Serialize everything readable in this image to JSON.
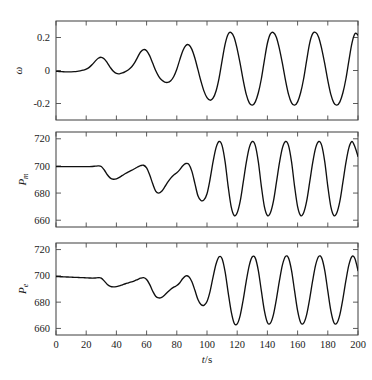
{
  "figure": {
    "background": "#ffffff",
    "line_color": "#101010",
    "axis_color": "#3c3c3c"
  },
  "chart_data": [
    {
      "type": "line",
      "panel_index": 0,
      "title": "",
      "xlabel": "",
      "ylabel": "ω",
      "ylabel_parts": {
        "base": "ω",
        "sub": ""
      },
      "xlim": [
        0,
        200
      ],
      "ylim": [
        -0.3,
        0.3
      ],
      "xticks": [
        0,
        20,
        40,
        60,
        80,
        100,
        120,
        140,
        160,
        180,
        200
      ],
      "xticklabels": [
        "",
        "",
        "",
        "",
        "",
        "",
        "",
        "",
        "",
        "",
        ""
      ],
      "yticks": [
        0.2,
        0,
        -0.2
      ],
      "yticklabels": [
        "0.2",
        "0",
        "-0.2"
      ],
      "grid": false,
      "legend": "none",
      "series": [
        {
          "name": "ω",
          "x": [
            0,
            2,
            4,
            6,
            8,
            10,
            12,
            14,
            16,
            18,
            20,
            22,
            24,
            26,
            28,
            30,
            32,
            34,
            36,
            38,
            40,
            42,
            44,
            46,
            48,
            50,
            52,
            54,
            56,
            58,
            60,
            62,
            64,
            66,
            68,
            70,
            72,
            74,
            76,
            78,
            80,
            82,
            84,
            86,
            88,
            90,
            92,
            94,
            96,
            98,
            100,
            102,
            104,
            106,
            108,
            110,
            112,
            114,
            116,
            118,
            120,
            122,
            124,
            126,
            128,
            130,
            132,
            134,
            136,
            138,
            140,
            142,
            144,
            146,
            148,
            150,
            152,
            154,
            156,
            158,
            160,
            162,
            164,
            166,
            168,
            170,
            172,
            174,
            176,
            178,
            180,
            182,
            184,
            186,
            188,
            190,
            192,
            194,
            196,
            198,
            200
          ],
          "values": [
            -0.005,
            -0.006,
            -0.007,
            -0.008,
            -0.008,
            -0.008,
            -0.007,
            -0.005,
            -0.002,
            0.002,
            0.008,
            0.019,
            0.036,
            0.057,
            0.074,
            0.08,
            0.07,
            0.046,
            0.018,
            -0.005,
            -0.018,
            -0.02,
            -0.015,
            -0.006,
            0.005,
            0.021,
            0.046,
            0.08,
            0.112,
            0.127,
            0.12,
            0.09,
            0.045,
            0.0,
            -0.035,
            -0.058,
            -0.07,
            -0.072,
            -0.062,
            -0.036,
            0.008,
            0.066,
            0.12,
            0.152,
            0.155,
            0.128,
            0.074,
            0.005,
            -0.065,
            -0.125,
            -0.165,
            -0.18,
            -0.168,
            -0.124,
            -0.046,
            0.06,
            0.16,
            0.22,
            0.23,
            0.2,
            0.13,
            0.04,
            -0.06,
            -0.145,
            -0.196,
            -0.21,
            -0.19,
            -0.135,
            -0.05,
            0.062,
            0.165,
            0.222,
            0.23,
            0.2,
            0.13,
            0.04,
            -0.06,
            -0.145,
            -0.196,
            -0.21,
            -0.19,
            -0.135,
            -0.05,
            0.062,
            0.166,
            0.223,
            0.23,
            0.2,
            0.13,
            0.04,
            -0.06,
            -0.145,
            -0.196,
            -0.21,
            -0.19,
            -0.135,
            -0.05,
            0.062,
            0.166,
            0.223,
            0.215
          ]
        }
      ]
    },
    {
      "type": "line",
      "panel_index": 1,
      "title": "",
      "xlabel": "",
      "ylabel": "P_m",
      "ylabel_parts": {
        "base": "P",
        "sub": "m"
      },
      "xlim": [
        0,
        200
      ],
      "ylim": [
        655,
        725
      ],
      "xticks": [
        0,
        20,
        40,
        60,
        80,
        100,
        120,
        140,
        160,
        180,
        200
      ],
      "xticklabels": [
        "",
        "",
        "",
        "",
        "",
        "",
        "",
        "",
        "",
        "",
        ""
      ],
      "yticks": [
        720,
        700,
        680,
        660
      ],
      "yticklabels": [
        "720",
        "700",
        "680",
        "660"
      ],
      "grid": false,
      "legend": "none",
      "series": [
        {
          "name": "P_m",
          "x": [
            0,
            2,
            4,
            6,
            8,
            10,
            12,
            14,
            16,
            18,
            20,
            22,
            24,
            26,
            28,
            30,
            32,
            34,
            36,
            38,
            40,
            42,
            44,
            46,
            48,
            50,
            52,
            54,
            56,
            58,
            60,
            62,
            64,
            66,
            68,
            70,
            72,
            74,
            76,
            78,
            80,
            82,
            84,
            86,
            88,
            90,
            92,
            94,
            96,
            98,
            100,
            102,
            104,
            106,
            108,
            110,
            112,
            114,
            116,
            118,
            120,
            122,
            124,
            126,
            128,
            130,
            132,
            134,
            136,
            138,
            140,
            142,
            144,
            146,
            148,
            150,
            152,
            154,
            156,
            158,
            160,
            162,
            164,
            166,
            168,
            170,
            172,
            174,
            176,
            178,
            180,
            182,
            184,
            186,
            188,
            190,
            192,
            194,
            196,
            198,
            200
          ],
          "values": [
            699.5,
            699.5,
            699.5,
            699.5,
            699.5,
            699.5,
            699.5,
            699.5,
            699.5,
            699.5,
            699.5,
            699.5,
            699.6,
            699.8,
            700.0,
            699.6,
            697.0,
            693.5,
            691.0,
            690.2,
            690.5,
            691.6,
            693.0,
            694.4,
            695.6,
            696.7,
            697.9,
            699.2,
            700.2,
            700.5,
            698.5,
            693.5,
            687.0,
            681.5,
            680.0,
            681.4,
            684.5,
            688.0,
            691.0,
            693.3,
            695.0,
            697.3,
            700.2,
            701.8,
            701.2,
            696.0,
            687.0,
            678.0,
            674.5,
            675.0,
            679.5,
            690.0,
            703.0,
            713.5,
            718.0,
            715.0,
            703.0,
            685.0,
            670.0,
            663.5,
            665.5,
            674.0,
            688.0,
            702.5,
            713.5,
            718.0,
            715.0,
            703.0,
            685.0,
            670.0,
            663.5,
            665.5,
            674.0,
            688.0,
            702.5,
            713.5,
            718.0,
            715.0,
            703.0,
            685.0,
            670.0,
            663.5,
            665.5,
            674.0,
            688.0,
            702.5,
            713.5,
            718.0,
            715.0,
            703.0,
            685.0,
            670.0,
            663.5,
            665.5,
            674.0,
            688.0,
            702.5,
            713.5,
            718.0,
            714.0,
            707.0
          ]
        }
      ]
    },
    {
      "type": "line",
      "panel_index": 2,
      "title": "",
      "xlabel": "t/s",
      "ylabel": "P_e",
      "ylabel_parts": {
        "base": "P",
        "sub": "e"
      },
      "xlim": [
        0,
        200
      ],
      "ylim": [
        655,
        725
      ],
      "xticks": [
        0,
        20,
        40,
        60,
        80,
        100,
        120,
        140,
        160,
        180,
        200
      ],
      "xticklabels": [
        "0",
        "20",
        "40",
        "60",
        "80",
        "100",
        "120",
        "140",
        "160",
        "180",
        "200"
      ],
      "yticks": [
        720,
        700,
        680,
        660
      ],
      "yticklabels": [
        "720",
        "700",
        "680",
        "660"
      ],
      "grid": false,
      "legend": "none",
      "series": [
        {
          "name": "P_e",
          "x": [
            0,
            2,
            4,
            6,
            8,
            10,
            12,
            14,
            16,
            18,
            20,
            22,
            24,
            26,
            28,
            30,
            32,
            34,
            36,
            38,
            40,
            42,
            44,
            46,
            48,
            50,
            52,
            54,
            56,
            58,
            60,
            62,
            64,
            66,
            68,
            70,
            72,
            74,
            76,
            78,
            80,
            82,
            84,
            86,
            88,
            90,
            92,
            94,
            96,
            98,
            100,
            102,
            104,
            106,
            108,
            110,
            112,
            114,
            116,
            118,
            120,
            122,
            124,
            126,
            128,
            130,
            132,
            134,
            136,
            138,
            140,
            142,
            144,
            146,
            148,
            150,
            152,
            154,
            156,
            158,
            160,
            162,
            164,
            166,
            168,
            170,
            172,
            174,
            176,
            178,
            180,
            182,
            184,
            186,
            188,
            190,
            192,
            194,
            196,
            198,
            200
          ],
          "values": [
            699.5,
            699.4,
            699.3,
            699.2,
            699.1,
            699.0,
            698.9,
            698.8,
            698.7,
            698.6,
            698.5,
            698.4,
            698.3,
            698.4,
            698.6,
            698.3,
            696.0,
            693.5,
            692.0,
            691.6,
            691.8,
            692.4,
            693.2,
            694.0,
            694.7,
            695.4,
            696.2,
            697.2,
            698.2,
            698.6,
            697.2,
            693.5,
            688.5,
            684.5,
            683.2,
            683.6,
            685.4,
            687.7,
            689.8,
            691.4,
            692.6,
            694.8,
            698.0,
            700.0,
            699.3,
            695.5,
            689.0,
            682.0,
            678.2,
            677.6,
            680.5,
            688.0,
            699.0,
            709.0,
            714.5,
            713.0,
            703.0,
            687.5,
            673.0,
            664.0,
            663.5,
            670.0,
            682.0,
            696.0,
            708.0,
            714.5,
            713.5,
            704.0,
            688.5,
            673.5,
            664.5,
            664.0,
            670.5,
            682.5,
            696.5,
            708.5,
            714.8,
            713.5,
            704.0,
            688.5,
            673.5,
            664.5,
            664.0,
            670.5,
            682.5,
            696.5,
            708.5,
            714.8,
            713.5,
            704.0,
            688.5,
            673.5,
            664.5,
            664.0,
            670.5,
            682.5,
            696.5,
            708.5,
            714.8,
            713.0,
            704.0
          ]
        }
      ]
    }
  ]
}
